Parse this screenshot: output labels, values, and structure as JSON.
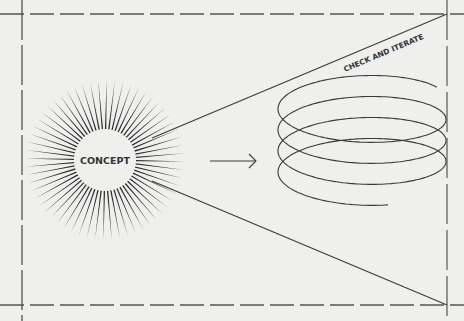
{
  "diagram": {
    "center_label": "CONCEPT",
    "cone_label": "CHECK AND ITERATE",
    "ray_count": 60,
    "spiral_turns": 4,
    "colors": {
      "background": "#efefee",
      "ink": "#3a3a3a",
      "frame": "#555555"
    },
    "elements": [
      {
        "id": "concept-burst",
        "type": "sunburst",
        "label": "CONCEPT"
      },
      {
        "id": "flow-arrow",
        "type": "arrow",
        "from": "concept-burst",
        "to": "iteration-spiral"
      },
      {
        "id": "iteration-spiral",
        "type": "spiral",
        "label": "CHECK AND ITERATE"
      },
      {
        "id": "cone",
        "type": "expanding-cone",
        "from": "concept-burst"
      }
    ]
  }
}
